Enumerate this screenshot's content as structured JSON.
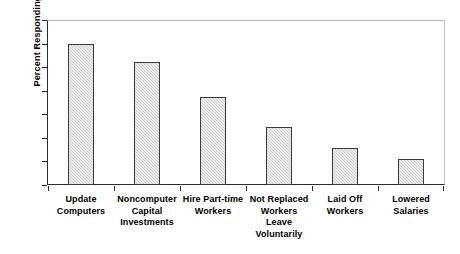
{
  "chart_data": {
    "type": "bar",
    "title": "",
    "xlabel": "",
    "ylabel": "Percent Responding",
    "ylim": [
      0,
      70
    ],
    "ytick_step": 10,
    "yticks": [
      0,
      10,
      20,
      30,
      40,
      50,
      60,
      70
    ],
    "grid": false,
    "legend": null,
    "categories": [
      "Update Computers",
      "Noncomputer Capital Investments",
      "Hire Part-time Workers",
      "Not Replaced Workers Leave Voluntarily",
      "Laid Off Workers",
      "Lowered Salaries"
    ],
    "category_lines": [
      [
        "Update",
        "Computers"
      ],
      [
        "Noncomputer",
        "Capital",
        "Investments"
      ],
      [
        "Hire Part-time",
        "Workers"
      ],
      [
        "Not Replaced",
        "Workers",
        "Leave",
        "Voluntarily"
      ],
      [
        "Laid Off",
        "Workers"
      ],
      [
        "Lowered",
        "Salaries"
      ]
    ],
    "values": [
      60,
      52,
      37.5,
      24.5,
      15.5,
      11
    ],
    "colors": {
      "bar_fill": "#d2d2d2",
      "bar_border": "#3a3a3a",
      "axis": "#2b2b2b",
      "frame": "#c9c9c9",
      "text": "#000000",
      "background": "#ffffff"
    }
  }
}
